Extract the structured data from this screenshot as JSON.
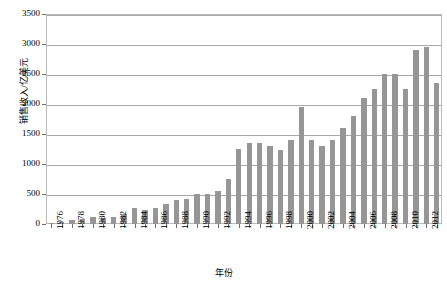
{
  "chart_data": {
    "type": "bar",
    "title": "",
    "xlabel": "年份",
    "ylabel": "销售收入/亿美元",
    "ylim": [
      0,
      3500
    ],
    "ytick_step": 500,
    "ytick_labels": [
      "0",
      "500",
      "1000",
      "1500",
      "2000",
      "2500",
      "3000",
      "3500"
    ],
    "grid": true,
    "legend": "none",
    "bar_color": "#969696",
    "xtick_label_interval": 2,
    "categories": [
      "1976",
      "1977",
      "1978",
      "1979",
      "1980",
      "1981",
      "1982",
      "1983",
      "1984",
      "1985",
      "1986",
      "1987",
      "1988",
      "1989",
      "1990",
      "1991",
      "1992",
      "1993",
      "1994",
      "1995",
      "1996",
      "1997",
      "1998",
      "1999",
      "2000",
      "2001",
      "2002",
      "2003",
      "2004",
      "2005",
      "2006",
      "2007",
      "2008",
      "2009",
      "2010",
      "2011",
      "2012",
      "2013"
    ],
    "values": [
      20,
      40,
      60,
      80,
      120,
      100,
      110,
      170,
      260,
      230,
      260,
      330,
      400,
      420,
      500,
      500,
      550,
      750,
      1250,
      1350,
      1350,
      1300,
      1230,
      1400,
      1950,
      1400,
      1300,
      1400,
      1600,
      1800,
      2100,
      2250,
      2500,
      2500,
      2250,
      2900,
      2950,
      2350
    ]
  },
  "axes": {
    "y_title": "销售收入/亿美元",
    "x_title": "年份"
  }
}
